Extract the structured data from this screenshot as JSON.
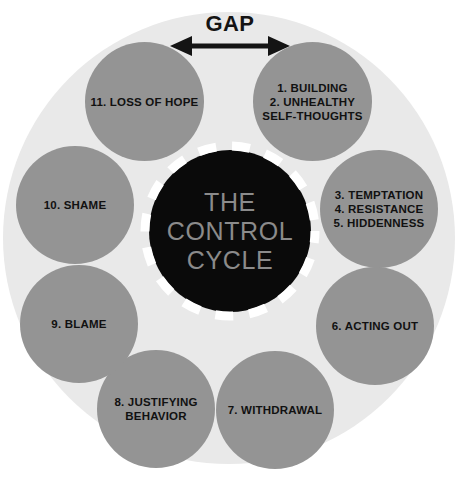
{
  "diagram": {
    "title": "THE CONTROL CYCLE",
    "center": {
      "line1": "THE",
      "line2": "CONTROL",
      "line3": "CYCLE"
    },
    "gap": {
      "label": "GAP",
      "arrow_icon": "double-headed-horizontal-arrow-icon"
    },
    "colors": {
      "background": "#ffffff",
      "outer_disc": "#e9e9e9",
      "node_fill": "#949494",
      "core_fill": "#0a0a0a",
      "core_text": "#8b8b8b",
      "node_text": "#111111",
      "dash_ring": "#ffffff",
      "arrow": "#141414"
    },
    "nodes": [
      {
        "id": "building-unhealthy-self-thoughts",
        "label": "1. BUILDING\n2. UNHEALTHY\nSELF-THOUGHTS",
        "steps": "1, 2",
        "angle_deg": 45
      },
      {
        "id": "temptation-resistance-hiddenness",
        "label": "3. TEMPTATION\n4. RESISTANCE\n5. HIDDENNESS",
        "steps": "3, 4, 5",
        "angle_deg": 0
      },
      {
        "id": "acting-out",
        "label": "6. ACTING OUT",
        "steps": "6",
        "angle_deg": -45
      },
      {
        "id": "withdrawal",
        "label": "7. WITHDRAWAL",
        "steps": "7",
        "angle_deg": -80
      },
      {
        "id": "justifying-behavior",
        "label": "8. JUSTIFYING\nBEHAVIOR",
        "steps": "8",
        "angle_deg": -125
      },
      {
        "id": "blame",
        "label": "9. BLAME",
        "steps": "9",
        "angle_deg": 200
      },
      {
        "id": "shame",
        "label": "10. SHAME",
        "steps": "10",
        "angle_deg": 160
      },
      {
        "id": "loss-of-hope",
        "label": "11. LOSS OF HOPE",
        "steps": "11",
        "angle_deg": 120
      }
    ]
  }
}
